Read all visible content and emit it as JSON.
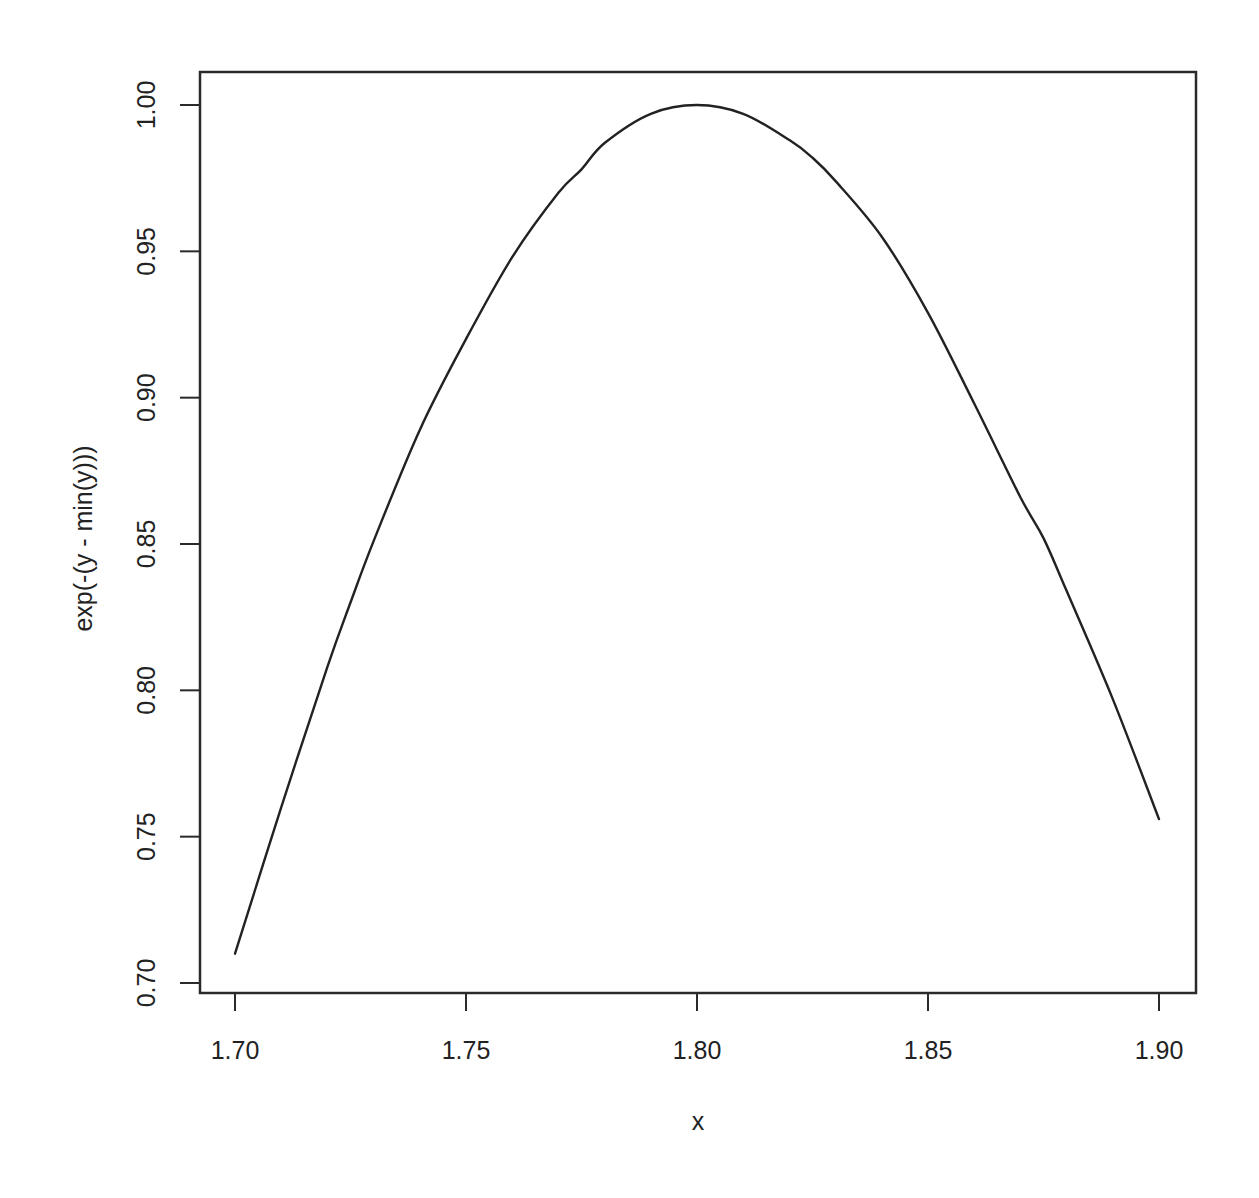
{
  "chart_data": {
    "type": "line",
    "title": "",
    "xlabel": "x",
    "ylabel": "exp(-(y - min(y)))",
    "xlim": [
      1.692,
      1.908
    ],
    "ylim": [
      0.697,
      1.012
    ],
    "grid": false,
    "legend": null,
    "x_ticks": [
      1.7,
      1.75,
      1.8,
      1.85,
      1.9
    ],
    "x_tick_labels": [
      "1.70",
      "1.75",
      "1.80",
      "1.85",
      "1.90"
    ],
    "y_ticks": [
      0.7,
      0.75,
      0.8,
      0.85,
      0.9,
      0.95,
      1.0
    ],
    "y_tick_labels": [
      "0.70",
      "0.75",
      "0.80",
      "0.85",
      "0.90",
      "0.95",
      "1.00"
    ],
    "series": [
      {
        "name": "exp(-(y - min(y)))",
        "color": "#222222",
        "x": [
          1.7,
          1.71,
          1.72,
          1.725,
          1.73,
          1.74,
          1.75,
          1.76,
          1.77,
          1.775,
          1.78,
          1.79,
          1.8,
          1.81,
          1.82,
          1.825,
          1.83,
          1.84,
          1.85,
          1.86,
          1.87,
          1.875,
          1.88,
          1.89,
          1.9
        ],
        "values": [
          0.71,
          0.76,
          0.808,
          0.83,
          0.851,
          0.889,
          0.92,
          0.948,
          0.97,
          0.978,
          0.987,
          0.997,
          1.0,
          0.997,
          0.988,
          0.982,
          0.974,
          0.955,
          0.929,
          0.898,
          0.866,
          0.852,
          0.834,
          0.797,
          0.756
        ]
      }
    ]
  },
  "layout": {
    "plot_box": {
      "left": 200,
      "top": 72,
      "right": 1196,
      "bottom": 993
    },
    "x_map": {
      "v0": 1.7,
      "p0": 235,
      "v1": 1.9,
      "p1": 1159
    },
    "y_map": {
      "v0": 0.7,
      "p0": 983,
      "v1": 1.0,
      "p1": 105
    }
  }
}
